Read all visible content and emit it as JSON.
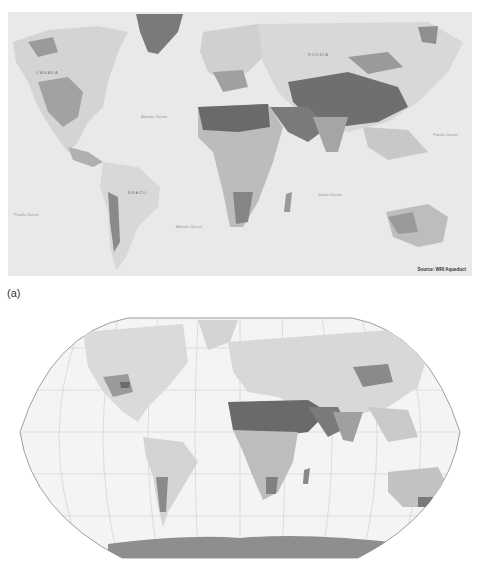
{
  "figure": {
    "panel_a": {
      "label": "(a)",
      "projection": "Mercator-style world map",
      "source": "Source: WRI Aqueduct",
      "ocean_labels": [
        "Atlantic Ocean",
        "Pacific Ocean",
        "Atlantic Ocean",
        "Indian Ocean",
        "Pacific Ocean"
      ],
      "country_labels": [
        "RUSSIA",
        "BRAZIL",
        "CANADA"
      ]
    },
    "panel_b": {
      "label": "(b)",
      "projection": "Robinson world map with graticule"
    },
    "colors": {
      "ocean_a": "#e9e9e9",
      "land_light": "#d6d6d6",
      "land_mid": "#a8a8a8",
      "land_dark": "#6f6f6f",
      "greenland": "#7a7a7a",
      "antarctica": "#8e8e8e",
      "graticule": "#c4c4c4",
      "outline": "#888888"
    }
  }
}
